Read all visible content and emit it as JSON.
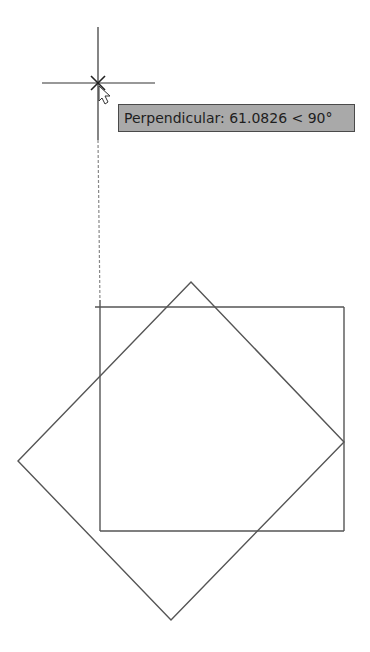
{
  "canvas": {
    "width": 370,
    "height": 652,
    "background": "#ffffff",
    "stroke_color": "#555555"
  },
  "cursor": {
    "crosshair_center": [
      98,
      83
    ],
    "snap_marker": "perpendicular",
    "pointer_icon": "arrow-cursor"
  },
  "tracking_line": {
    "style": "dashed",
    "from": [
      98,
      140
    ],
    "to": [
      100,
      306
    ]
  },
  "tooltip": {
    "label": "Perpendicular",
    "distance": "61.0826",
    "angle": "90°",
    "text": "Perpendicular: 61.0826 < 90°"
  },
  "shapes": {
    "rectangle": {
      "x1": 100,
      "y1": 307,
      "x2": 344,
      "y2": 531
    },
    "diamond": {
      "top": [
        191,
        282
      ],
      "right": [
        344,
        442
      ],
      "bottom": [
        171,
        620
      ],
      "left": [
        18,
        461
      ]
    }
  }
}
